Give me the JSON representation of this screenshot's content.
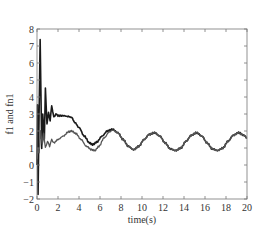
{
  "chart_data": {
    "type": "line",
    "title": "",
    "xlabel": "time(s)",
    "ylabel": "f1 and fn1",
    "xlim": [
      0,
      20
    ],
    "ylim": [
      -2,
      8
    ],
    "xticks": [
      0,
      2,
      4,
      6,
      8,
      10,
      12,
      14,
      16,
      18,
      20
    ],
    "yticks": [
      -2,
      -1,
      0,
      1,
      2,
      3,
      4,
      5,
      6,
      7,
      8
    ],
    "grid": false,
    "legend": null,
    "series": [
      {
        "name": "f1",
        "color": "#1a1a1a",
        "width": 1.6,
        "x": [
          0,
          0.05,
          0.1,
          0.2,
          0.3,
          0.45,
          0.55,
          0.7,
          0.8,
          0.95,
          1.1,
          1.25,
          1.4,
          1.6,
          1.8,
          2.0,
          2.5,
          3.0,
          3.3,
          3.6,
          4.0,
          4.5,
          5.0,
          5.3,
          5.7,
          6.2,
          6.7,
          7.2,
          7.7,
          8.2,
          8.7,
          9.2,
          9.7,
          10.2,
          10.7,
          11.2,
          11.7,
          12.2,
          12.7,
          13.2,
          13.7,
          14.2,
          14.7,
          15.2,
          15.7,
          16.2,
          16.7,
          17.2,
          17.7,
          18.2,
          18.7,
          19.2,
          19.7,
          20.0
        ],
        "y": [
          0,
          3.5,
          -1.7,
          3.0,
          7.4,
          1.0,
          3.0,
          1.5,
          4.5,
          2.4,
          3.1,
          2.6,
          3.5,
          2.8,
          3.0,
          2.9,
          2.9,
          2.85,
          2.8,
          2.5,
          2.2,
          1.7,
          1.3,
          1.2,
          1.35,
          1.7,
          2.0,
          2.1,
          1.9,
          1.5,
          1.1,
          0.9,
          1.1,
          1.5,
          1.8,
          1.9,
          1.7,
          1.3,
          0.95,
          0.85,
          1.0,
          1.4,
          1.75,
          1.9,
          1.7,
          1.3,
          0.95,
          0.85,
          1.0,
          1.4,
          1.75,
          1.9,
          1.75,
          1.6
        ]
      },
      {
        "name": "fn1",
        "color": "#555555",
        "width": 1.3,
        "x": [
          0,
          0.1,
          0.2,
          0.35,
          0.5,
          0.65,
          0.8,
          1.0,
          1.2,
          1.4,
          1.6,
          2.0,
          2.5,
          3.0,
          3.3,
          3.7,
          4.2,
          4.7,
          5.2,
          5.5,
          5.9,
          6.4,
          6.9,
          7.2,
          7.7,
          8.2,
          8.7,
          9.2,
          9.7,
          10.2,
          10.7,
          11.2,
          11.7,
          12.2,
          12.7,
          13.2,
          13.7,
          14.2,
          14.7,
          15.2,
          15.7,
          16.2,
          16.7,
          17.2,
          17.7,
          18.2,
          18.7,
          19.2,
          19.7,
          20.0
        ],
        "y": [
          0.3,
          1.0,
          0.7,
          2.0,
          1.2,
          1.8,
          1.0,
          1.4,
          1.1,
          1.5,
          1.3,
          1.5,
          1.7,
          1.95,
          2.0,
          1.85,
          1.5,
          1.1,
          0.9,
          0.85,
          1.1,
          1.6,
          1.95,
          2.05,
          1.9,
          1.5,
          1.1,
          0.9,
          1.1,
          1.5,
          1.8,
          1.9,
          1.7,
          1.3,
          0.95,
          0.85,
          1.0,
          1.4,
          1.75,
          1.9,
          1.7,
          1.3,
          0.95,
          0.85,
          1.0,
          1.4,
          1.75,
          1.9,
          1.75,
          1.6
        ]
      }
    ]
  }
}
